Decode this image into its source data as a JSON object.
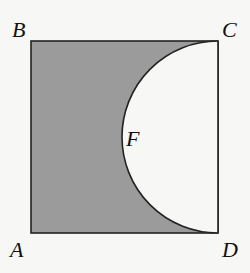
{
  "diagram": {
    "type": "geometry",
    "colors": {
      "background": "#f7f7f5",
      "shade": "#9b9b9b",
      "stroke": "#222222",
      "semicircle_fill": "#f7f7f5"
    },
    "square": {
      "vertices": {
        "A": {
          "x": 31,
          "y": 233
        },
        "B": {
          "x": 31,
          "y": 41
        },
        "C": {
          "x": 218,
          "y": 41
        },
        "D": {
          "x": 218,
          "y": 233
        }
      }
    },
    "semicircle": {
      "diameter": [
        "C",
        "D"
      ],
      "center": {
        "x": 218,
        "y": 137
      },
      "radius": 96,
      "direction": "inward"
    },
    "labels": {
      "A": "A",
      "B": "B",
      "C": "C",
      "D": "D",
      "F": "F"
    },
    "label_positions": {
      "A": {
        "x": 10,
        "y": 257
      },
      "B": {
        "x": 12,
        "y": 37
      },
      "C": {
        "x": 222,
        "y": 37
      },
      "D": {
        "x": 222,
        "y": 257
      },
      "F": {
        "x": 126,
        "y": 146
      }
    }
  }
}
